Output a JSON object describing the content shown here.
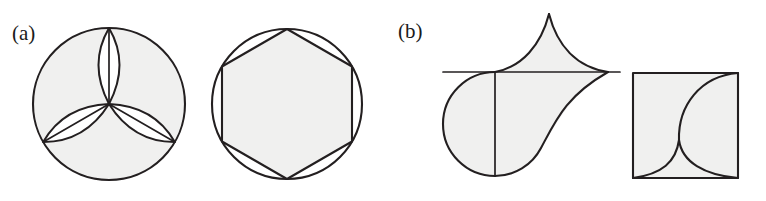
{
  "figure": {
    "background_color": "#ffffff",
    "stroke_color": "#231f20",
    "fill_color": "#f0f0ef",
    "width": 766,
    "height": 201,
    "panels": [
      {
        "id": "a",
        "label": "(a)",
        "label_x": 12,
        "label_y": 40,
        "shapes": [
          {
            "name": "circle-with-three-petals",
            "type": "circle",
            "cx": 109,
            "cy": 104,
            "r": 76,
            "petals": 3,
            "petal_rotations_deg": [
              0,
              120,
              240
            ],
            "description": "Circle containing three vesica-piscis petals radiating from the centre, each bisected by a straight chord"
          },
          {
            "name": "circle-with-inscribed-hexagon",
            "type": "circle",
            "cx": 287,
            "cy": 104,
            "r": 75,
            "polygon_sides": 6,
            "polygon_rotation_deg": -90,
            "description": "Circle with an inscribed regular hexagon, vertex pointing up"
          }
        ]
      },
      {
        "id": "b",
        "label": "(b)",
        "label_x": 398,
        "label_y": 38,
        "shapes": [
          {
            "name": "teardrop-cusp-shape",
            "type": "compound",
            "cx": 495,
            "cy": 124,
            "r": 52,
            "cusp_apex_x": 549,
            "cusp_apex_y": 14,
            "right_tip_x": 608,
            "right_tip_y": 72,
            "baseline_y": 72,
            "description": "Circle with vertical diameter, joined to a cusped spiral lobe rising to a sharp point above and tapering to a tip on the right"
          },
          {
            "name": "square-with-two-arcs",
            "type": "square",
            "x": 633,
            "y": 73,
            "size": 105,
            "cusp_x": 679,
            "cusp_y": 140,
            "description": "Square crossed by a large arc from the top-right corner and a smaller arc to the bottom-left corner, meeting at a cusp"
          }
        ]
      }
    ]
  }
}
